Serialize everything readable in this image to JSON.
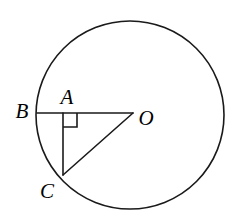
{
  "figure": {
    "type": "geometry-diagram",
    "background_color": "#ffffff",
    "stroke_color": "#1a1a1a",
    "label_color": "#000000",
    "canvas": {
      "width": 244,
      "height": 224
    }
  },
  "circle": {
    "name": "main-circle",
    "center_x": 130,
    "center_y": 115,
    "radius": 94,
    "stroke_width": 1.6
  },
  "points": {
    "B": {
      "label": "B",
      "x": 37,
      "y": 113,
      "label_x": 22,
      "label_y": 111
    },
    "A": {
      "label": "A",
      "x": 63,
      "y": 113,
      "label_x": 67,
      "label_y": 97
    },
    "O": {
      "label": "O",
      "x": 133,
      "y": 113,
      "label_x": 146,
      "label_y": 118
    },
    "C": {
      "label": "C",
      "x": 63,
      "y": 174,
      "label_x": 47,
      "label_y": 191
    }
  },
  "segments": [
    {
      "name": "segment-BO",
      "from": "B",
      "to": "O",
      "x1": 37,
      "y1": 113,
      "x2": 133,
      "y2": 113
    },
    {
      "name": "segment-AC",
      "from": "A",
      "to": "C",
      "x1": 63,
      "y1": 113,
      "x2": 63,
      "y2": 175
    },
    {
      "name": "segment-CO",
      "from": "C",
      "to": "O",
      "x1": 63,
      "y1": 175,
      "x2": 133,
      "y2": 113
    }
  ],
  "right_angle_mark": {
    "name": "right-angle-mark-at-A",
    "at_point": "A",
    "size": 14,
    "x": 63,
    "y": 113,
    "stroke_width": 1.6
  }
}
